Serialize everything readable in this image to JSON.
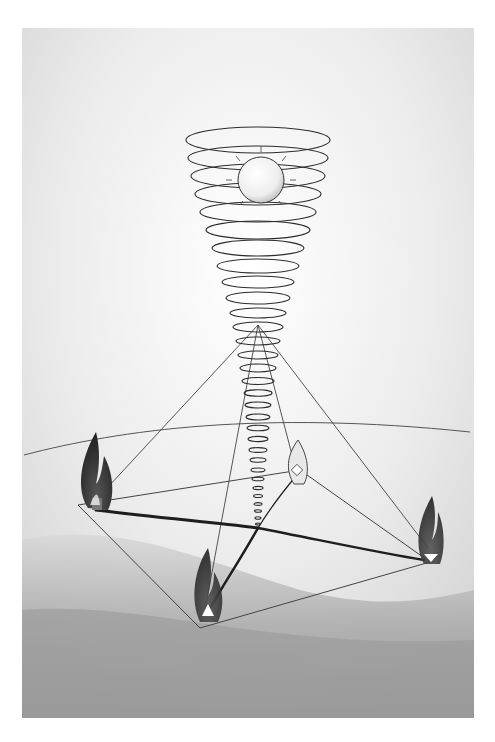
{
  "image": {
    "kind": "illustration",
    "description": "Pencil/watercolor drawing: a glowing sphere at the top of a downward-tapering spiral vortex that descends to the center of a square ground plane; four flames sit at the corners of the plane, connected to the center by dark lines and to the vortex apex by thin lines forming a pyramid.",
    "colors": {
      "background": "#ffffff",
      "sky_wash": "#e6e6e6",
      "ground_wash": "#a8a8a8",
      "line": "#333333",
      "flame_dark": "#2a2a2a",
      "flame_mid": "#6a6a6a",
      "sphere": "#f2f2f2"
    },
    "elements": [
      "sphere",
      "spiral-vortex",
      "pyramid-lines",
      "ground-plane",
      "flame-left",
      "flame-front",
      "flame-right",
      "flame-back"
    ]
  }
}
